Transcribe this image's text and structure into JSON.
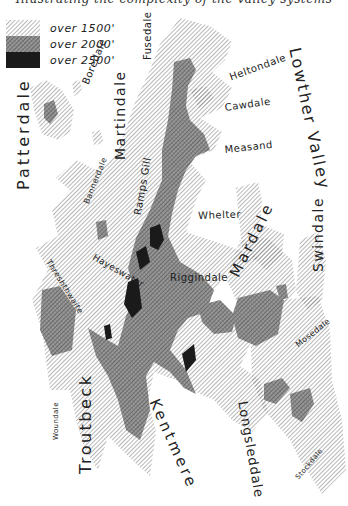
{
  "title": "Illustrating the complexity of the valley systems",
  "legend": {
    "items": [
      {
        "label": "over 1500'",
        "pattern": "light-hatch"
      },
      {
        "label": "over 2000'",
        "pattern": "cross-hatch"
      },
      {
        "label": "over 2500'",
        "pattern": "solid-black"
      }
    ]
  },
  "colors": {
    "background": "#ffffff",
    "hatch_light": "#8a8a8a",
    "hatch_medium": "#6a6a6a",
    "solid": "#1a1a1a"
  },
  "labels": {
    "patterdale": "Patterdale",
    "boredale": "Boredale",
    "martindale": "Martindale",
    "fusedale": "Fusedale",
    "heltondale": "Heltondale",
    "lowther_valley": "Lowther Valley",
    "cawdale": "Cawdale",
    "measand": "Measand",
    "bannerdale": "Bannerdale",
    "ramps_gill": "Ramps Gill",
    "wheiter": "Whelter",
    "mardale": "Mardale",
    "swindale": "Swindale",
    "hayeswater": "Hayeswater",
    "threshthwaite": "Threshthwaite",
    "riggindale": "Riggindale",
    "mosedale": "Mosedale",
    "woundale": "Woundale",
    "troutbeck": "Troutbeck",
    "kentmere": "Kentmere",
    "longsleddale": "Longsleddale",
    "stockdale": "Stockdale"
  }
}
